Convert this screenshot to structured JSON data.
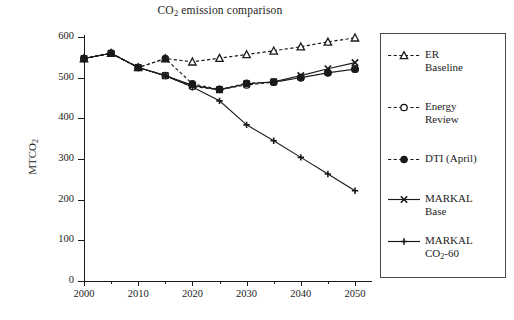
{
  "chart_data": {
    "type": "line",
    "title": "CO2 emission comparison",
    "title_parts": {
      "pre": "CO",
      "sub": "2",
      "post": " emission comparison"
    },
    "xlabel": "",
    "ylabel": "MTCO2",
    "ylabel_parts": {
      "pre": "MTCO",
      "sub": "2"
    },
    "xlim": [
      2000,
      2050
    ],
    "ylim": [
      0,
      600
    ],
    "grid": false,
    "legend_position": "right",
    "x_tick_labels": [
      "2000",
      "2010",
      "2020",
      "2030",
      "2040",
      "2050"
    ],
    "x_tick_values": [
      2000,
      2010,
      2020,
      2030,
      2040,
      2050
    ],
    "x_minor_ticks": [
      2005,
      2015,
      2025,
      2035,
      2045
    ],
    "y_tick_labels": [
      "0",
      "100",
      "200",
      "300",
      "400",
      "500",
      "600"
    ],
    "y_tick_values": [
      0,
      100,
      200,
      300,
      400,
      500,
      600
    ],
    "x": [
      2000,
      2005,
      2010,
      2015,
      2020,
      2025,
      2030,
      2035,
      2040,
      2045,
      2050
    ],
    "series": [
      {
        "name": "ER Baseline",
        "label_lines": [
          "ER",
          "Baseline"
        ],
        "marker": "triangle",
        "line_style": "dashed",
        "color": "#1a1a1a",
        "values": [
          547,
          560,
          525,
          547,
          539,
          548,
          557,
          566,
          576,
          588,
          598
        ]
      },
      {
        "name": "Energy Review",
        "label_lines": [
          "Energy",
          "Review"
        ],
        "marker": "circle",
        "line_style": "dashed",
        "color": "#1a1a1a",
        "values": [
          547,
          560,
          525,
          505,
          478,
          471,
          482,
          489,
          500,
          512,
          521
        ]
      },
      {
        "name": "DTI (April)",
        "label_lines": [
          "DTI (April)"
        ],
        "marker": "dot",
        "line_style": "dashed",
        "color": "#1a1a1a",
        "values": [
          547,
          560,
          525,
          547,
          485,
          471,
          486,
          489,
          500,
          512,
          521
        ]
      },
      {
        "name": "MARKAL Base",
        "label_lines": [
          "MARKAL",
          "Base"
        ],
        "marker": "cross-x",
        "line_style": "solid",
        "color": "#1a1a1a",
        "values": [
          547,
          560,
          525,
          505,
          481,
          470,
          485,
          490,
          505,
          522,
          537
        ]
      },
      {
        "name": "MARKAL CO2-60",
        "label_lines": [
          "MARKAL",
          "CO2-60"
        ],
        "label_line2_parts": {
          "pre": "CO",
          "sub": "2",
          "post": "-60"
        },
        "marker": "plus",
        "line_style": "solid",
        "color": "#1a1a1a",
        "values": [
          547,
          560,
          525,
          505,
          477,
          443,
          384,
          345,
          304,
          263,
          222
        ]
      }
    ]
  }
}
